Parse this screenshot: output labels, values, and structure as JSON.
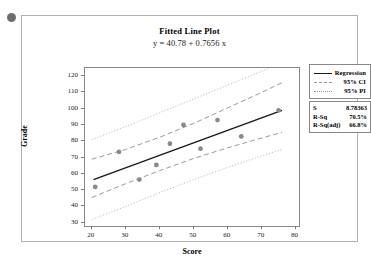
{
  "chart_data": {
    "type": "scatter",
    "title": "Fitted Line Plot",
    "subtitle": "y = 40.78 + 0.7656 x",
    "xlabel": "Score",
    "ylabel": "Grade",
    "xlim": [
      18,
      81
    ],
    "ylim": [
      28,
      125
    ],
    "xticks": [
      20,
      30,
      40,
      50,
      60,
      70,
      80
    ],
    "yticks": [
      30,
      40,
      50,
      60,
      70,
      80,
      90,
      100,
      110,
      120
    ],
    "grid": false,
    "legend_position": "right",
    "regression": {
      "intercept": 40.78,
      "slope": 0.7656
    },
    "points": [
      {
        "x": 21,
        "y": 52
      },
      {
        "x": 28,
        "y": 73.5
      },
      {
        "x": 34,
        "y": 56.5
      },
      {
        "x": 39,
        "y": 65.5
      },
      {
        "x": 43,
        "y": 78.5
      },
      {
        "x": 47,
        "y": 90
      },
      {
        "x": 52,
        "y": 75.5
      },
      {
        "x": 57,
        "y": 93
      },
      {
        "x": 64,
        "y": 83
      },
      {
        "x": 75,
        "y": 99
      }
    ],
    "series": [
      {
        "name": "Regression",
        "style": "solid"
      },
      {
        "name": "95% CI",
        "style": "dashed"
      },
      {
        "name": "95% PI",
        "style": "dotted"
      }
    ],
    "ci_upper": [
      {
        "x": 20,
        "y": 69
      },
      {
        "x": 30,
        "y": 75
      },
      {
        "x": 40,
        "y": 82.5
      },
      {
        "x": 50,
        "y": 91
      },
      {
        "x": 60,
        "y": 100.5
      },
      {
        "x": 70,
        "y": 110
      },
      {
        "x": 76,
        "y": 116
      }
    ],
    "ci_lower": [
      {
        "x": 20,
        "y": 45.5
      },
      {
        "x": 30,
        "y": 54
      },
      {
        "x": 40,
        "y": 62
      },
      {
        "x": 50,
        "y": 69.5
      },
      {
        "x": 60,
        "y": 76
      },
      {
        "x": 70,
        "y": 82
      },
      {
        "x": 76,
        "y": 85.5
      }
    ],
    "pi_upper": [
      {
        "x": 20,
        "y": 81
      },
      {
        "x": 30,
        "y": 89
      },
      {
        "x": 40,
        "y": 97.5
      },
      {
        "x": 50,
        "y": 106
      },
      {
        "x": 60,
        "y": 114.5
      },
      {
        "x": 70,
        "y": 123
      },
      {
        "x": 76,
        "y": 128
      }
    ],
    "pi_lower": [
      {
        "x": 20,
        "y": 32
      },
      {
        "x": 30,
        "y": 40
      },
      {
        "x": 40,
        "y": 48.5
      },
      {
        "x": 50,
        "y": 56.5
      },
      {
        "x": 60,
        "y": 64
      },
      {
        "x": 70,
        "y": 71
      },
      {
        "x": 76,
        "y": 75
      }
    ],
    "colors": {
      "regression": "#1a1a1a",
      "ci": "#9a9a9a",
      "pi": "#b5b5b5",
      "marker": "#8a8a8a",
      "frame": "#888888"
    }
  },
  "legend": {
    "items": [
      {
        "label": "Regression",
        "style": "solid"
      },
      {
        "label": "95% CI",
        "style": "dashed"
      },
      {
        "label": "95% PI",
        "style": "dotted"
      }
    ]
  },
  "stats": {
    "rows": [
      {
        "label": "S",
        "value": "8.78363"
      },
      {
        "label": "R-Sq",
        "value": "70.5%"
      },
      {
        "label": "R-Sq(adj)",
        "value": "66.8%"
      }
    ]
  }
}
